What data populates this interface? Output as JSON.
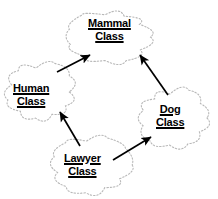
{
  "diagram": {
    "background_color": "#ffffff",
    "node_outline_color": "#b8b8b8",
    "label_color": "#000000",
    "edge_color": "#000000",
    "nodes": [
      {
        "id": "mammal",
        "line1": "Mammal",
        "line2": "Class",
        "label_x": 88,
        "label_y": 17,
        "cloud_cx": 110,
        "cloud_cy": 37,
        "cloud_rx": 39,
        "cloud_ry": 26
      },
      {
        "id": "human",
        "line1": "Human",
        "line2": "Class",
        "label_x": 13,
        "label_y": 82,
        "cloud_cx": 40,
        "cloud_cy": 92,
        "cloud_rx": 33,
        "cloud_ry": 28
      },
      {
        "id": "dog",
        "line1": "Dog",
        "line2": "Class",
        "label_x": 156,
        "label_y": 103,
        "cloud_cx": 174,
        "cloud_cy": 118,
        "cloud_rx": 33,
        "cloud_ry": 28
      },
      {
        "id": "lawyer",
        "line1": "Lawyer",
        "line2": "Class",
        "label_x": 64,
        "label_y": 152,
        "cloud_cx": 91,
        "cloud_cy": 165,
        "cloud_rx": 37,
        "cloud_ry": 28
      }
    ],
    "edges": [
      {
        "id": "human-to-mammal",
        "from": "human",
        "to": "mammal",
        "x1": 57,
        "y1": 72,
        "x2": 90,
        "y2": 55,
        "relationship": "inherits"
      },
      {
        "id": "dog-to-mammal",
        "from": "dog",
        "to": "mammal",
        "x1": 168,
        "y1": 95,
        "x2": 140,
        "y2": 55,
        "relationship": "inherits"
      },
      {
        "id": "lawyer-to-human",
        "from": "lawyer",
        "to": "human",
        "x1": 80,
        "y1": 146,
        "x2": 60,
        "y2": 112,
        "relationship": "inherits"
      },
      {
        "id": "lawyer-to-dog",
        "from": "lawyer",
        "to": "dog",
        "x1": 113,
        "y1": 160,
        "x2": 151,
        "y2": 137,
        "relationship": "inherits"
      }
    ]
  }
}
